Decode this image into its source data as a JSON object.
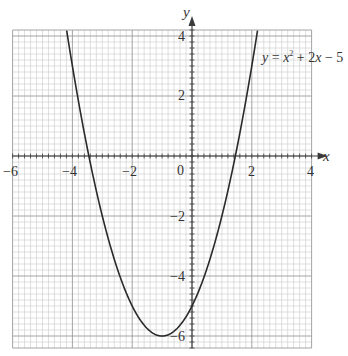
{
  "chart_data": {
    "type": "line",
    "title": "",
    "xlabel": "x",
    "ylabel": "y",
    "xlim": [
      -6,
      4
    ],
    "ylim": [
      -6.4,
      4.2
    ],
    "grid": true,
    "minor_grid_step": 0.2,
    "major_grid_step": 2,
    "x_ticks": [
      -6,
      -4,
      -2,
      0,
      2,
      4
    ],
    "x_tick_labels": [
      "−6",
      "−4",
      "−2",
      "0",
      "2",
      "4"
    ],
    "y_ticks": [
      -6,
      -4,
      -2,
      2,
      4
    ],
    "y_tick_labels": [
      "−6",
      "−4",
      "−2",
      "2",
      "4"
    ],
    "origin_label": "0",
    "series": [
      {
        "name": "y = x² + 2x − 5",
        "equation": {
          "a": 1,
          "b": 2,
          "c": -5
        },
        "x": [
          -4.2,
          -4,
          -3.5,
          -3,
          -2.5,
          -2,
          -1.5,
          -1,
          -0.5,
          0,
          0.5,
          1,
          1.5,
          2,
          2.2
        ],
        "values": [
          3.24,
          3,
          0.25,
          -2,
          -3.75,
          -5,
          -5.75,
          -6,
          -5.75,
          -5,
          -3.75,
          -2,
          0.25,
          3,
          4.24
        ]
      }
    ],
    "annotations": [
      {
        "text_parts": [
          "y",
          " = ",
          "x",
          "2",
          " + 2",
          "x",
          " − 5"
        ],
        "label": "y = x² + 2x − 5",
        "x": 1.5,
        "y": 3.3
      }
    ]
  },
  "labels": {
    "x_axis": "x",
    "y_axis": "y",
    "equation": {
      "y": "y",
      "eq": " = ",
      "x1": "x",
      "sup": "2",
      "plus": " + 2",
      "x2": "x",
      "minus": " − 5"
    },
    "x_ticks": [
      "−6",
      "−4",
      "−2",
      "2",
      "4"
    ],
    "y_ticks": [
      "4",
      "2",
      "−2",
      "−4",
      "−6"
    ],
    "origin": "0"
  }
}
